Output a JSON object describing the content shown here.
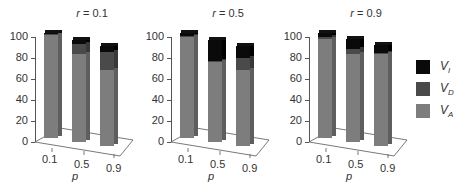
{
  "chart_data": {
    "type": "bar",
    "stacked": true,
    "three_d": true,
    "panels": [
      {
        "title": "r = 0.1",
        "title_var": "r",
        "title_value": "0.1",
        "categories": [
          "0.1",
          "0.5",
          "0.9"
        ],
        "series": [
          {
            "name": "VA",
            "values": [
              98,
              84,
              72
            ]
          },
          {
            "name": "VD",
            "values": [
              1,
              9,
              18
            ]
          },
          {
            "name": "VI",
            "values": [
              1,
              4,
              5
            ]
          }
        ]
      },
      {
        "title": "r = 0.5",
        "title_var": "r",
        "title_value": "0.5",
        "categories": [
          "0.1",
          "0.5",
          "0.9"
        ],
        "series": [
          {
            "name": "VA",
            "values": [
              96,
              76,
              72
            ]
          },
          {
            "name": "VD",
            "values": [
              1,
              1,
              12
            ]
          },
          {
            "name": "VI",
            "values": [
              3,
              20,
              11
            ]
          }
        ]
      },
      {
        "title": "r = 0.9",
        "title_var": "r",
        "title_value": "0.9",
        "categories": [
          "0.1",
          "0.5",
          "0.9"
        ],
        "series": [
          {
            "name": "VA",
            "values": [
              94,
              84,
              88
            ]
          },
          {
            "name": "VD",
            "values": [
              2,
              5,
              1
            ]
          },
          {
            "name": "VI",
            "values": [
              4,
              9,
              7
            ]
          }
        ]
      }
    ],
    "xlabel": "p",
    "ylabel": "",
    "yticks": [
      0,
      20,
      40,
      60,
      80,
      100
    ],
    "ylim": [
      0,
      100
    ],
    "grid": false,
    "legend": {
      "position": "right",
      "entries": [
        {
          "label": "V",
          "sub": "I",
          "color": "#0a0a0a"
        },
        {
          "label": "V",
          "sub": "D",
          "color": "#4a4a4a"
        },
        {
          "label": "V",
          "sub": "A",
          "color": "#7d7d7d"
        }
      ]
    }
  },
  "colors": {
    "VA": "#7d7d7d",
    "VA_side": "#5e5e5e",
    "VD": "#4a4a4a",
    "VD_side": "#383838",
    "VI": "#0a0a0a",
    "VI_side": "#000000",
    "axis": "#555555"
  }
}
